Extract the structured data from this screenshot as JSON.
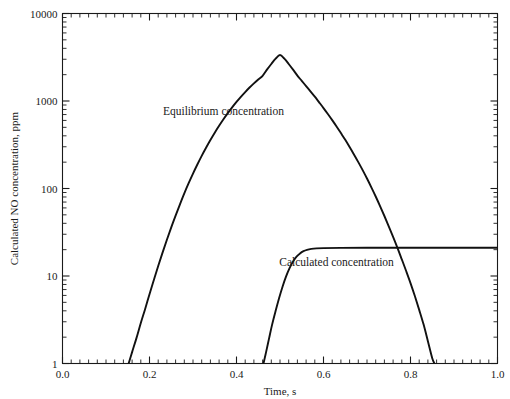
{
  "chart_data": {
    "type": "line",
    "title": "",
    "xlabel": "Time, s",
    "ylabel": "Calculated NO concentration, ppm",
    "xlim": [
      0.0,
      1.0
    ],
    "ylim": [
      1,
      10000
    ],
    "yscale": "log",
    "xscale": "linear",
    "grid": false,
    "legend_position": "inline-annotation",
    "xticks": [
      "0.0",
      "0.2",
      "0.4",
      "0.6",
      "0.8",
      "1.0"
    ],
    "xtick_values": [
      0.0,
      0.2,
      0.4,
      0.6,
      0.8,
      1.0
    ],
    "xminor_step": 0.02,
    "yticks": [
      "1",
      "10",
      "100",
      "1000",
      "10000"
    ],
    "ytick_values": [
      1,
      10,
      100,
      1000,
      10000
    ],
    "annotations": [
      {
        "text": "Equilibrium concentration",
        "x": 0.37,
        "y": 700
      },
      {
        "text": "Calculated concentration",
        "x": 0.63,
        "y": 13
      }
    ],
    "series": [
      {
        "name": "Equilibrium concentration",
        "points": [
          [
            0.152,
            1.0
          ],
          [
            0.16,
            1.35
          ],
          [
            0.17,
            1.95
          ],
          [
            0.18,
            2.9
          ],
          [
            0.19,
            4.2
          ],
          [
            0.2,
            6.2
          ],
          [
            0.21,
            9.0
          ],
          [
            0.22,
            13.0
          ],
          [
            0.23,
            18.5
          ],
          [
            0.24,
            26.0
          ],
          [
            0.25,
            36.0
          ],
          [
            0.26,
            49.0
          ],
          [
            0.27,
            66.0
          ],
          [
            0.28,
            88.0
          ],
          [
            0.29,
            115.0
          ],
          [
            0.3,
            148.0
          ],
          [
            0.31,
            188.0
          ],
          [
            0.32,
            236.0
          ],
          [
            0.33,
            292.0
          ],
          [
            0.34,
            358.0
          ],
          [
            0.35,
            434.0
          ],
          [
            0.36,
            520.0
          ],
          [
            0.37,
            618.0
          ],
          [
            0.38,
            726.0
          ],
          [
            0.39,
            845.0
          ],
          [
            0.4,
            975.0
          ],
          [
            0.41,
            1115.0
          ],
          [
            0.42,
            1265.0
          ],
          [
            0.43,
            1425.0
          ],
          [
            0.44,
            1592.0
          ],
          [
            0.45,
            1765.0
          ],
          [
            0.46,
            1942.0
          ],
          [
            0.47,
            2280.0
          ],
          [
            0.48,
            2650.0
          ],
          [
            0.49,
            3050.0
          ],
          [
            0.5,
            3350.0
          ],
          [
            0.51,
            3050.0
          ],
          [
            0.52,
            2650.0
          ],
          [
            0.53,
            2280.0
          ],
          [
            0.54,
            1950.0
          ],
          [
            0.55,
            1700.0
          ],
          [
            0.56,
            1480.0
          ],
          [
            0.57,
            1290.0
          ],
          [
            0.58,
            1120.0
          ],
          [
            0.59,
            965.0
          ],
          [
            0.6,
            830.0
          ],
          [
            0.61,
            710.0
          ],
          [
            0.62,
            605.0
          ],
          [
            0.63,
            512.0
          ],
          [
            0.64,
            430.0
          ],
          [
            0.65,
            360.0
          ],
          [
            0.66,
            298.0
          ],
          [
            0.67,
            245.0
          ],
          [
            0.68,
            200.0
          ],
          [
            0.69,
            162.0
          ],
          [
            0.7,
            130.0
          ],
          [
            0.71,
            103.0
          ],
          [
            0.72,
            81.0
          ],
          [
            0.73,
            63.0
          ],
          [
            0.74,
            48.5
          ],
          [
            0.75,
            37.0
          ],
          [
            0.76,
            28.0
          ],
          [
            0.77,
            21.0
          ],
          [
            0.78,
            15.5
          ],
          [
            0.79,
            11.4
          ],
          [
            0.8,
            8.3
          ],
          [
            0.81,
            5.9
          ],
          [
            0.82,
            4.1
          ],
          [
            0.83,
            2.8
          ],
          [
            0.84,
            1.8
          ],
          [
            0.85,
            1.15
          ],
          [
            0.855,
            1.0
          ]
        ]
      },
      {
        "name": "Calculated concentration",
        "points": [
          [
            0.462,
            1.0
          ],
          [
            0.468,
            1.35
          ],
          [
            0.475,
            1.95
          ],
          [
            0.482,
            2.8
          ],
          [
            0.49,
            4.0
          ],
          [
            0.498,
            5.6
          ],
          [
            0.506,
            7.6
          ],
          [
            0.514,
            9.9
          ],
          [
            0.522,
            12.3
          ],
          [
            0.53,
            14.6
          ],
          [
            0.538,
            16.6
          ],
          [
            0.546,
            18.1
          ],
          [
            0.554,
            19.2
          ],
          [
            0.562,
            19.9
          ],
          [
            0.572,
            20.4
          ],
          [
            0.584,
            20.7
          ],
          [
            0.6,
            20.85
          ],
          [
            0.64,
            20.95
          ],
          [
            0.7,
            21.0
          ],
          [
            0.8,
            21.0
          ],
          [
            0.9,
            21.0
          ],
          [
            1.0,
            21.0
          ]
        ]
      }
    ]
  }
}
